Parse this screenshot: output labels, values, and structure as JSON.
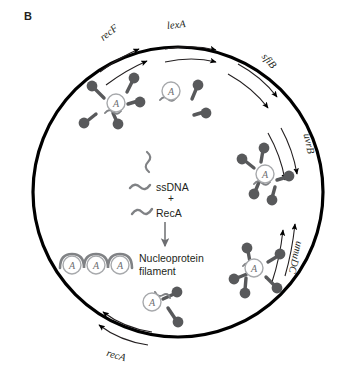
{
  "figure": {
    "panel_letter": "B",
    "type": "biological-schematic"
  },
  "cell": {
    "shape": "circle",
    "center_x": 178,
    "center_y": 192,
    "radius": 145,
    "membrane_color": "#000000",
    "membrane_width": 3.2,
    "fill_color": "#ffffff"
  },
  "gene_labels": [
    {
      "id": "recF",
      "text": "recF",
      "x": 106,
      "y": 40,
      "rotation": -38
    },
    {
      "id": "lexA",
      "text": "lexA",
      "x": 171,
      "y": 27,
      "rotation": -6
    },
    {
      "id": "sfiB",
      "text": "sfiB",
      "x": 272,
      "y": 57,
      "rotation": 50
    },
    {
      "id": "uvrB",
      "text": "uvrB",
      "x": 313,
      "y": 135,
      "rotation": 78
    },
    {
      "id": "umuDC",
      "text": "umuDC",
      "x": 307,
      "y": 243,
      "rotation": 104
    },
    {
      "id": "recA",
      "text": "recA",
      "x": 113,
      "y": 354,
      "rotation": 16
    }
  ],
  "center_reaction": {
    "ssDNA_label": "ssDNA",
    "plus_sign": "+",
    "recA_label": "RecA",
    "product_label_line1": "Nucleoprotein",
    "product_label_line2": "filament",
    "arrow_direction": "down"
  },
  "recA_circle_letter": "A",
  "colors": {
    "monomer_fill": "#58595b",
    "monomer_stroke": "#3f4042",
    "dna_strand": "#808285",
    "recA_circle_stroke": "#a7a9ac",
    "text": "#231f20",
    "membrane": "#000000",
    "arrow": "#000000"
  },
  "monomer_clusters": [
    {
      "id": "cluster-upper-left",
      "label_x": 116,
      "label_y": 103,
      "count": 5
    },
    {
      "id": "cluster-top-center",
      "label_x": 171,
      "label_y": 91,
      "count": 2
    },
    {
      "id": "cluster-middle-right",
      "label_x": 265,
      "label_y": 174,
      "count": 5
    },
    {
      "id": "cluster-lower-right",
      "label_x": 254,
      "label_y": 268,
      "count": 5
    },
    {
      "id": "cluster-bottom-center",
      "label_x": 152,
      "label_y": 302,
      "count": 2
    }
  ],
  "nucleoprotein_filament": {
    "subunit_count": 3,
    "subunit_label": "A",
    "x_positions": [
      72,
      95,
      118
    ],
    "y": 265
  },
  "transcription_arrows": [
    {
      "gene": "recF",
      "direction": "clockwise",
      "count": 2
    },
    {
      "gene": "lexA",
      "direction": "clockwise",
      "count": 2
    },
    {
      "gene": "sfiB",
      "direction": "clockwise",
      "count": 2
    },
    {
      "gene": "uvrB",
      "direction": "clockwise",
      "count": 2
    },
    {
      "gene": "umuDC",
      "direction": "counterclockwise",
      "count": 2
    },
    {
      "gene": "recA",
      "direction": "counterclockwise",
      "count": 2
    }
  ]
}
